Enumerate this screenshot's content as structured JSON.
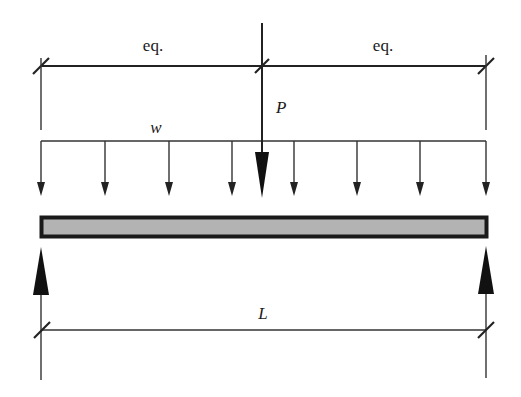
{
  "diagram": {
    "type": "simply-supported-beam",
    "colors": {
      "line": "#222222",
      "beam_fill": "#b3b3b3",
      "beam_border": "#1a1a1a",
      "background": "#ffffff"
    },
    "labels": {
      "left_span": "eq.",
      "right_span": "eq.",
      "point_load": "P",
      "distributed_load": "w",
      "beam_length": "L"
    },
    "loads": {
      "point_load": {
        "symbol": "P",
        "position": "midspan",
        "direction": "down"
      },
      "distributed_load": {
        "symbol": "w",
        "arrow_count": 8,
        "direction": "down"
      }
    },
    "supports": [
      {
        "position": "left",
        "reaction": "up"
      },
      {
        "position": "right",
        "reaction": "up"
      }
    ],
    "dimensions": [
      {
        "label": "eq.",
        "from": "left-support",
        "to": "midspan"
      },
      {
        "label": "eq.",
        "from": "midspan",
        "to": "right-support"
      },
      {
        "label": "L",
        "from": "left-support",
        "to": "right-support"
      }
    ]
  }
}
